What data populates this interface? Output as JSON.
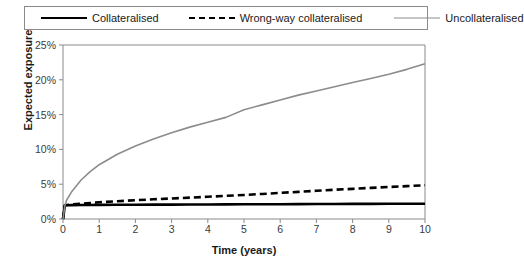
{
  "chart_data": {
    "type": "line",
    "title": "",
    "xlabel": "Time (years)",
    "ylabel": "Expected exposure",
    "xlim": [
      0,
      10
    ],
    "ylim": [
      0,
      0.25
    ],
    "grid": false,
    "legend_position": "top",
    "x_ticks": [
      "0",
      "1",
      "2",
      "3",
      "4",
      "5",
      "6",
      "7",
      "8",
      "9",
      "10"
    ],
    "x_tick_values": [
      0,
      1,
      2,
      3,
      4,
      5,
      6,
      7,
      8,
      9,
      10
    ],
    "y_ticks": [
      "0%",
      "5%",
      "10%",
      "15%",
      "20%",
      "25%"
    ],
    "y_tick_values": [
      0,
      5,
      10,
      15,
      20,
      25
    ],
    "x": [
      0,
      0.05,
      0.1,
      0.25,
      0.5,
      0.75,
      1,
      1.5,
      2,
      2.5,
      3,
      3.5,
      4,
      4.5,
      5,
      5.5,
      6,
      6.5,
      7,
      7.5,
      8,
      8.5,
      9,
      9.5,
      10
    ],
    "series": [
      {
        "name": "Collateralised",
        "style": "solid",
        "color": "#000000",
        "width": 2.6,
        "values": [
          0.0,
          1.95,
          1.98,
          2.0,
          2.01,
          2.02,
          2.03,
          2.04,
          2.05,
          2.06,
          2.07,
          2.08,
          2.09,
          2.1,
          2.11,
          2.12,
          2.13,
          2.14,
          2.15,
          2.16,
          2.17,
          2.18,
          2.19,
          2.2,
          2.2
        ]
      },
      {
        "name": "Wrong-way collateralised",
        "style": "dashed",
        "color": "#000000",
        "width": 2.6,
        "values": [
          0.0,
          1.95,
          2.0,
          2.1,
          2.2,
          2.3,
          2.4,
          2.55,
          2.7,
          2.83,
          2.95,
          3.07,
          3.2,
          3.33,
          3.45,
          3.6,
          3.75,
          3.9,
          4.05,
          4.2,
          4.33,
          4.47,
          4.6,
          4.72,
          4.85
        ]
      },
      {
        "name": "Uncollateralised",
        "style": "solid",
        "color": "#8c8c8c",
        "width": 1.6,
        "values": [
          0.0,
          1.9,
          2.7,
          4.0,
          5.6,
          6.8,
          7.8,
          9.3,
          10.5,
          11.5,
          12.4,
          13.2,
          13.9,
          14.6,
          15.7,
          16.4,
          17.1,
          17.8,
          18.4,
          19.0,
          19.6,
          20.2,
          20.8,
          21.5,
          22.3
        ]
      }
    ]
  },
  "legend": {
    "items": [
      {
        "label": "Collateralised",
        "swatch": "sw-solid-black"
      },
      {
        "label": "Wrong-way collateralised",
        "swatch": "sw-dashed-black"
      },
      {
        "label": "Uncollateralised",
        "swatch": "sw-solid-gray"
      }
    ]
  },
  "axes": {
    "y_title": "Expected exposure",
    "x_title": "Time (years)"
  },
  "colors": {
    "series_black": "#000000",
    "series_gray": "#8c8c8c",
    "axis": "#8a8a8a",
    "text": "#1a1a1a"
  }
}
